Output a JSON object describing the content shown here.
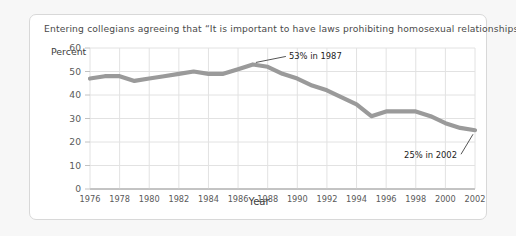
{
  "card": {
    "title": "Entering collegians agreeing that “It is important to have laws prohibiting homosexual relationships.”"
  },
  "chart_data": {
    "type": "line",
    "title": "Entering collegians agreeing that “It is important to have laws prohibiting homosexual relationships.”",
    "xlabel": "Year",
    "ylabel": "Percent",
    "xlim": [
      1976,
      2002
    ],
    "ylim": [
      0,
      60
    ],
    "yticks": [
      0,
      10,
      20,
      30,
      40,
      50,
      60
    ],
    "xticks": [
      1976,
      1978,
      1980,
      1982,
      1984,
      1986,
      1988,
      1990,
      1992,
      1994,
      1996,
      1998,
      2000,
      2002
    ],
    "grid": true,
    "legend": "none",
    "line_color": "#9a9a9a",
    "x": [
      1976,
      1977,
      1978,
      1979,
      1980,
      1981,
      1982,
      1983,
      1984,
      1985,
      1986,
      1987,
      1988,
      1989,
      1990,
      1991,
      1992,
      1993,
      1994,
      1995,
      1996,
      1997,
      1998,
      1999,
      2000,
      2001,
      2002
    ],
    "values": [
      47,
      48,
      48,
      46,
      47,
      48,
      49,
      50,
      49,
      49,
      51,
      53,
      52,
      49,
      47,
      44,
      42,
      39,
      36,
      31,
      33,
      33,
      33,
      31,
      28,
      26,
      25
    ],
    "annotations": [
      {
        "label": "53% in 1987",
        "x": 1987,
        "y": 53
      },
      {
        "label": "25% in 2002",
        "x": 2002,
        "y": 25
      }
    ]
  },
  "axis": {
    "ylabel": "Percent",
    "xlabel": "Year",
    "yticks": [
      "0",
      "10",
      "20",
      "30",
      "40",
      "50",
      "60"
    ],
    "xticks": [
      "1976",
      "1978",
      "1980",
      "1982",
      "1984",
      "1986",
      "1988",
      "1990",
      "1992",
      "1994",
      "1996",
      "1998",
      "2000",
      "2002"
    ]
  },
  "annotations": {
    "peak": "53% in 1987",
    "end": "25% in 2002"
  }
}
